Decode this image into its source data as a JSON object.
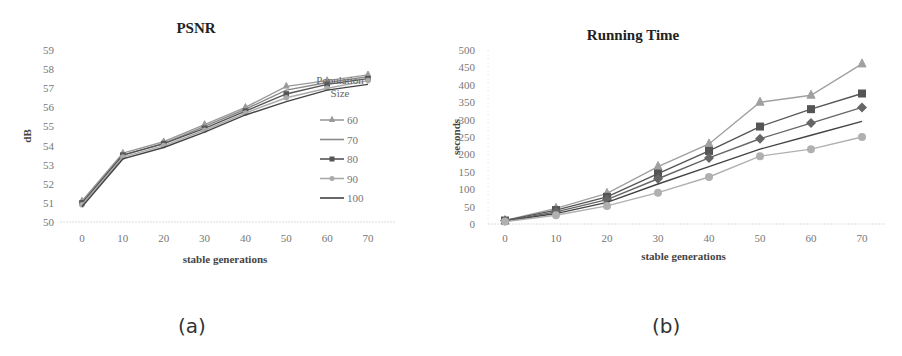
{
  "captions": {
    "a": "(a)",
    "b": "(b)"
  },
  "chart_data": [
    {
      "id": "a",
      "type": "line",
      "title": "PSNR",
      "xlabel": "stable generations",
      "ylabel": "dB",
      "x": [
        0,
        10,
        20,
        30,
        40,
        50,
        60,
        70
      ],
      "xticks": [
        "0",
        "10",
        "20",
        "30",
        "40",
        "50",
        "60",
        "70"
      ],
      "ylim": [
        50,
        59
      ],
      "yticks": [
        "50",
        "51",
        "52",
        "53",
        "54",
        "55",
        "56",
        "57",
        "58",
        "59"
      ],
      "legend_title": "Population Size",
      "legend_position": "right",
      "grid": false,
      "series": [
        {
          "name": "60",
          "marker": "triangle",
          "color": "#9a9a9a",
          "values": [
            51.1,
            53.6,
            54.2,
            55.1,
            56.0,
            57.1,
            57.4,
            57.7
          ]
        },
        {
          "name": "70",
          "marker": "none",
          "color": "#8a8a8a",
          "values": [
            51.0,
            53.5,
            54.1,
            55.0,
            55.9,
            56.9,
            57.3,
            57.6
          ]
        },
        {
          "name": "80",
          "marker": "square",
          "color": "#555555",
          "values": [
            51.0,
            53.5,
            54.1,
            54.9,
            55.8,
            56.7,
            57.2,
            57.5
          ]
        },
        {
          "name": "90",
          "marker": "circle",
          "color": "#aaaaaa",
          "values": [
            50.9,
            53.4,
            54.0,
            54.8,
            55.7,
            56.5,
            57.0,
            57.4
          ]
        },
        {
          "name": "100",
          "marker": "none",
          "color": "#444444",
          "values": [
            50.8,
            53.3,
            53.9,
            54.7,
            55.6,
            56.3,
            56.9,
            57.2
          ]
        }
      ]
    },
    {
      "id": "b",
      "type": "line",
      "title": "Running Time",
      "xlabel": "stable generations",
      "ylabel": "seconds",
      "x": [
        0,
        10,
        20,
        30,
        40,
        50,
        60,
        70
      ],
      "xticks": [
        "0",
        "10",
        "20",
        "30",
        "40",
        "50",
        "60",
        "70"
      ],
      "ylim": [
        0,
        500
      ],
      "yticks": [
        "0",
        "50",
        "100",
        "150",
        "200",
        "250",
        "300",
        "350",
        "400",
        "450",
        "500"
      ],
      "grid": false,
      "series": [
        {
          "name": "100",
          "marker": "triangle",
          "color": "#a0a0a0",
          "values": [
            10,
            45,
            88,
            165,
            230,
            350,
            370,
            460
          ]
        },
        {
          "name": "90",
          "marker": "square",
          "color": "#555555",
          "values": [
            10,
            40,
            78,
            145,
            210,
            280,
            330,
            375
          ]
        },
        {
          "name": "80",
          "marker": "diamond",
          "color": "#666666",
          "values": [
            9,
            35,
            70,
            130,
            190,
            245,
            290,
            335
          ]
        },
        {
          "name": "70",
          "marker": "none",
          "color": "#444444",
          "values": [
            8,
            30,
            62,
            115,
            165,
            215,
            255,
            295
          ]
        },
        {
          "name": "60",
          "marker": "circle",
          "color": "#b0b0b0",
          "values": [
            7,
            25,
            52,
            90,
            135,
            195,
            215,
            250
          ]
        }
      ]
    }
  ]
}
